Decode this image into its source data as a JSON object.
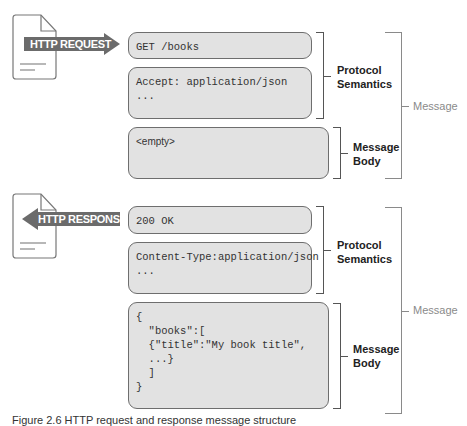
{
  "colors": {
    "box_fill": "#e2e2e2",
    "box_border": "#6e6e6e",
    "arrow_fill": "#6b6b6b",
    "label_dark": "#222222",
    "label_grey": "#8a8a8a"
  },
  "request": {
    "arrow_label": "HTTP REQUEST",
    "direction": "right",
    "boxes": [
      {
        "lines": "GET /books"
      },
      {
        "lines": "Accept: application/json\n..."
      },
      {
        "lines": "<empty>"
      }
    ],
    "brackets": {
      "protocol": "Protocol\nSemantics",
      "body": "Message\nBody",
      "message": "Message"
    }
  },
  "response": {
    "arrow_label": "HTTP RESPONSE",
    "direction": "left",
    "boxes": [
      {
        "lines": "200 OK"
      },
      {
        "lines": "Content-Type:application/json\n..."
      },
      {
        "lines": "{\n  \"books\":[\n  {\"title\":\"My book title\",\n  ...}\n  ]\n}"
      }
    ],
    "brackets": {
      "protocol": "Protocol\nSemantics",
      "body": "Message\nBody",
      "message": "Message"
    }
  },
  "caption": "Figure 2.6  HTTP request and response message structure"
}
